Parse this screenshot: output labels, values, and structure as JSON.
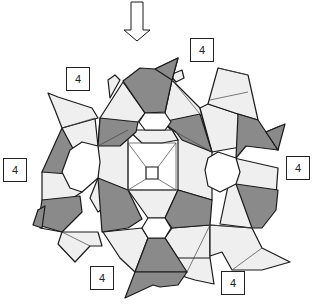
{
  "diagram": {
    "title": "",
    "arrow": {
      "direction": "down",
      "icon": "down-arrow-icon"
    },
    "labels": [
      {
        "id": "label-top-right",
        "text": "4"
      },
      {
        "id": "label-upper-left",
        "text": "4"
      },
      {
        "id": "label-left",
        "text": "4"
      },
      {
        "id": "label-right",
        "text": "4"
      },
      {
        "id": "label-bottom-left",
        "text": "4"
      },
      {
        "id": "label-bottom-right",
        "text": "4"
      }
    ],
    "colors": {
      "dark_face": "#8a8a8a",
      "light_face": "#efefef",
      "open_face": "#ffffff",
      "edge": "#1a1a1a"
    }
  }
}
